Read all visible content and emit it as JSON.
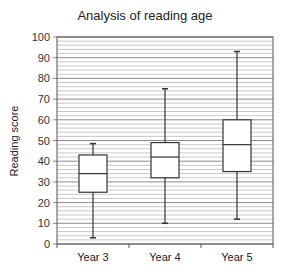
{
  "chart_data": {
    "type": "box",
    "title": "Analysis of reading age",
    "xlabel": "",
    "ylabel": "Reading score",
    "ylim": [
      0,
      100
    ],
    "yticks": [
      0,
      10,
      20,
      30,
      40,
      50,
      60,
      70,
      80,
      90,
      100
    ],
    "minor_grid_step": 2,
    "grid": true,
    "categories": [
      "Year 3",
      "Year 4",
      "Year 5"
    ],
    "series": [
      {
        "name": "Year 3",
        "min": 3,
        "q1": 25,
        "median": 34,
        "q3": 43,
        "max": 48.5
      },
      {
        "name": "Year 4",
        "min": 10,
        "q1": 32,
        "median": 42,
        "q3": 49,
        "max": 75
      },
      {
        "name": "Year 5",
        "min": 12,
        "q1": 35,
        "median": 48,
        "q3": 60,
        "max": 93
      }
    ]
  },
  "colors": {
    "grid_major": "#8a8a8a",
    "grid_minor": "#c8c8c8",
    "box_stroke": "#333333",
    "box_fill": "#ffffff"
  }
}
